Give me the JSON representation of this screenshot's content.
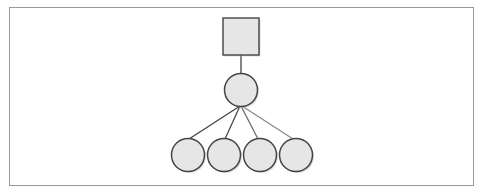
{
  "diagram": {
    "type": "tree",
    "frame": {
      "x": 9,
      "y": 7,
      "width": 465,
      "height": 179,
      "stroke": "#9a9a9a"
    },
    "style": {
      "fill": "#e6e6e6",
      "stroke": "#444444",
      "shadow": "#bdbdbd"
    },
    "nodes": [
      {
        "id": "root",
        "shape": "square",
        "x": 223,
        "y": 18,
        "width": 36,
        "height": 37
      },
      {
        "id": "mid",
        "shape": "circle",
        "cx": 241,
        "cy": 90,
        "r": 16.5
      },
      {
        "id": "leaf1",
        "shape": "circle",
        "cx": 188,
        "cy": 155,
        "r": 16.5
      },
      {
        "id": "leaf2",
        "shape": "circle",
        "cx": 224,
        "cy": 155,
        "r": 16.5
      },
      {
        "id": "leaf3",
        "shape": "circle",
        "cx": 260,
        "cy": 155,
        "r": 16.5
      },
      {
        "id": "leaf4",
        "shape": "circle",
        "cx": 296,
        "cy": 155,
        "r": 16.5
      }
    ],
    "edges": [
      {
        "from": "root",
        "to": "mid",
        "x1": 241,
        "y1": 55,
        "x2": 241,
        "y2": 73.5,
        "color": "#444444"
      },
      {
        "from": "mid",
        "to": "leaf1",
        "x1": 240,
        "y1": 106,
        "x2": 189,
        "y2": 139,
        "color": "#444444"
      },
      {
        "from": "mid",
        "to": "leaf2",
        "x1": 240,
        "y1": 106,
        "x2": 225,
        "y2": 139,
        "color": "#4a4a4a"
      },
      {
        "from": "mid",
        "to": "leaf3",
        "x1": 241,
        "y1": 106,
        "x2": 258,
        "y2": 139,
        "color": "#6a6a6a"
      },
      {
        "from": "mid",
        "to": "leaf4",
        "x1": 242,
        "y1": 106,
        "x2": 293,
        "y2": 139,
        "color": "#8a8a8a"
      }
    ]
  }
}
